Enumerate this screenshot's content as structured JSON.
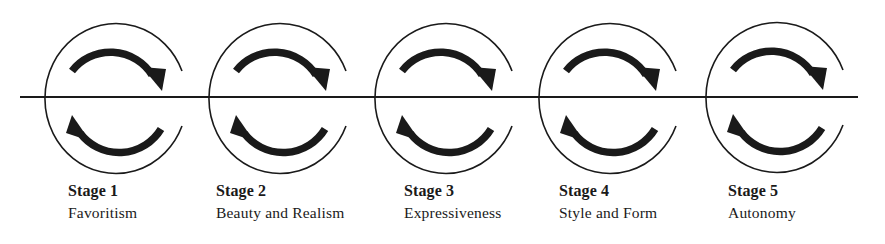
{
  "diagram": {
    "colors": {
      "stroke": "#1a1a1a",
      "background": "#ffffff"
    },
    "stages": [
      {
        "title": "Stage 1",
        "name": "Favoritism"
      },
      {
        "title": "Stage 2",
        "name": "Beauty and Realism"
      },
      {
        "title": "Stage 3",
        "name": "Expressiveness"
      },
      {
        "title": "Stage 4",
        "name": "Style and Form"
      },
      {
        "title": "Stage 5",
        "name": "Autonomy"
      }
    ]
  }
}
